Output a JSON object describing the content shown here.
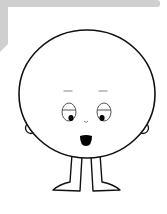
{
  "illustration": {
    "title": "Round-headed cartoon character",
    "colors": {
      "background": "#ffffff",
      "frame": "#cfcfcf",
      "outline": "#111111",
      "eye_outline": "#555555",
      "brow": "#888888",
      "fill": "#ffffff",
      "pupil": "#000000",
      "mouth": "#000000"
    },
    "parts": [
      "frame",
      "head",
      "left-ear",
      "right-ear",
      "left-eyebrow",
      "right-eyebrow",
      "left-eye",
      "right-eye",
      "nose",
      "mouth",
      "left-leg",
      "right-leg"
    ]
  }
}
